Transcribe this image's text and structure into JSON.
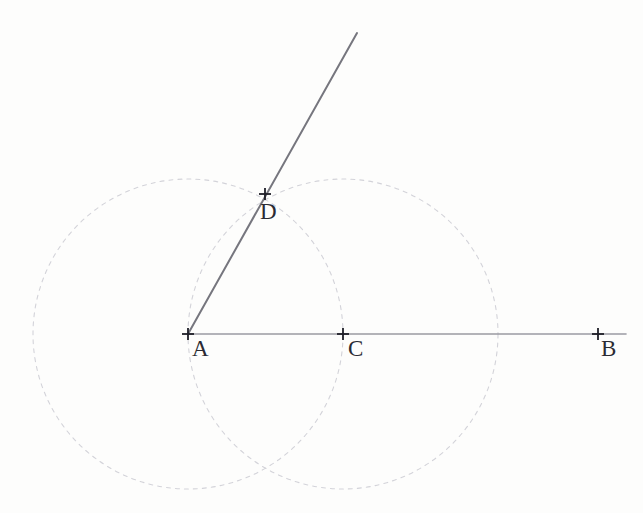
{
  "figure": {
    "kind": "geometry-construction-diagram",
    "width": 643,
    "height": 513,
    "background_color": "#fdfdfc",
    "colors": {
      "circle_stroke": "#d3d3d9",
      "baseline_stroke": "#9a9aa2",
      "ray_stroke": "#76767e",
      "marker_stroke": "#1f1f27",
      "label_color": "#2b2b33"
    },
    "points": [
      {
        "id": "A",
        "label": "A",
        "x": 188,
        "y": 334,
        "marker": "plus-tick"
      },
      {
        "id": "C",
        "label": "C",
        "x": 343,
        "y": 334,
        "marker": "plus-tick"
      },
      {
        "id": "B",
        "label": "B",
        "x": 598,
        "y": 334,
        "marker": "plus-tick"
      },
      {
        "id": "D",
        "label": "D",
        "x": 265,
        "y": 194,
        "marker": "plus-tick"
      }
    ],
    "circles": [
      {
        "id": "circle-A",
        "center_x": 188,
        "center_y": 334,
        "radius": 155,
        "style": "dashed"
      },
      {
        "id": "circle-C",
        "center_x": 343,
        "center_y": 334,
        "radius": 155,
        "style": "dashed"
      }
    ],
    "segments": [
      {
        "id": "baseline-AB",
        "x1": 188,
        "y1": 334,
        "x2": 625,
        "y2": 334,
        "style": "solid"
      },
      {
        "id": "ray-AD",
        "x1": 188,
        "y1": 334,
        "x2": 357,
        "y2": 33,
        "style": "solid"
      }
    ],
    "dash_pattern": "4 5",
    "marker_arm_length": 6
  }
}
